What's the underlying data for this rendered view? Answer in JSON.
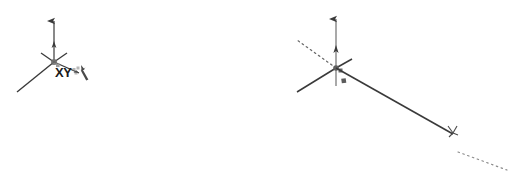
{
  "scene": {
    "background_color": "#ffffff",
    "width": 514,
    "height": 180,
    "stroke_color": "#3a3a3a",
    "dim_text_color": "#2b2b2b",
    "label_text_color": "#1a1a1a"
  },
  "figure_before": {
    "name": "sketch-start-state",
    "origin_label": "XY",
    "cursor_icon": "line-tool-cursor-icon",
    "origin_icon": "sketch-origin-icon",
    "axes": [
      {
        "name": "vertical-axis-arrow",
        "icon": "up-arrow-icon"
      },
      {
        "name": "left-axis-arrow",
        "icon": "diagonal-arrow-icon"
      },
      {
        "name": "right-axis-arrow",
        "icon": "diagonal-arrow-icon"
      }
    ]
  },
  "figure_after": {
    "name": "sketch-line-drawn-state",
    "origin_label": "XY",
    "cursor_icon": "line-tool-cursor-icon",
    "origin_icon": "sketch-origin-icon",
    "dimension_text": "97.6, 0°",
    "length_value": "97.6",
    "angle_value": "0°",
    "construction_line_style": "dotted",
    "line_midpoint_marker": "midpoint-square-marker",
    "endpoint_marker": "endpoint-snap-marker",
    "axes": [
      {
        "name": "vertical-axis-arrow",
        "icon": "up-arrow-icon"
      },
      {
        "name": "left-axis-arrow",
        "icon": "diagonal-arrow-icon"
      },
      {
        "name": "right-axis-arrow",
        "icon": "diagonal-arrow-icon"
      }
    ]
  }
}
